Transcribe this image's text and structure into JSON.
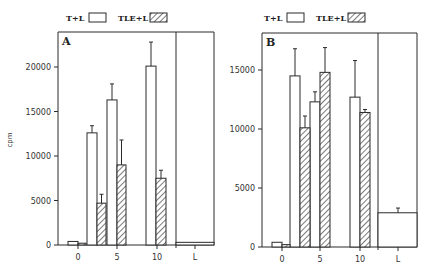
{
  "chart_data": [
    {
      "type": "bar",
      "panel": "A",
      "ylabel": "cpm",
      "ylim": [
        0,
        24000
      ],
      "yticks": [
        0,
        5000,
        10000,
        15000,
        20000
      ],
      "xtick_labels": [
        "0",
        "5",
        "10",
        "L"
      ],
      "legend": [
        {
          "name": "T+L",
          "pattern": "open"
        },
        {
          "name": "TLE+L",
          "pattern": "hatched"
        }
      ],
      "series": [
        {
          "name": "T+L",
          "x": [
            0,
            2,
            5,
            10
          ],
          "values": [
            400,
            12600,
            16300,
            20100
          ],
          "error": [
            0,
            800,
            1800,
            2700
          ]
        },
        {
          "name": "TLE+L",
          "x": [
            0,
            2,
            5,
            10
          ],
          "values": [
            200,
            4700,
            9000,
            7500
          ],
          "error": [
            0,
            1000,
            2800,
            900
          ]
        }
      ],
      "control": {
        "name": "L",
        "value": 300,
        "error": 0
      }
    },
    {
      "type": "bar",
      "panel": "B",
      "ylabel": "",
      "ylim": [
        0,
        18500
      ],
      "yticks": [
        0,
        5000,
        10000,
        15000
      ],
      "xtick_labels": [
        "0",
        "5",
        "10",
        "L"
      ],
      "legend": [
        {
          "name": "T+L",
          "pattern": "open"
        },
        {
          "name": "TLE+L",
          "pattern": "hatched"
        }
      ],
      "series": [
        {
          "name": "T+L",
          "x": [
            0,
            2,
            5,
            10
          ],
          "values": [
            400,
            14500,
            12300,
            12700
          ],
          "error": [
            0,
            2300,
            850,
            3100
          ]
        },
        {
          "name": "TLE+L",
          "x": [
            0,
            2,
            5,
            10
          ],
          "values": [
            200,
            10100,
            14800,
            11400
          ],
          "error": [
            0,
            1000,
            2100,
            250
          ]
        }
      ],
      "control": {
        "name": "L",
        "value": 2900,
        "error": 400
      }
    }
  ],
  "layout": {
    "panels": [
      {
        "label": "A",
        "frame": {
          "left": 58,
          "top": 32,
          "right": 214,
          "bottom": 245,
          "divider": 176
        },
        "y_px_per_unit": 0.0089,
        "xtick_px": [
          78,
          117,
          157,
          195
        ],
        "bars": {
          "T+L": [
            [
              68,
              78
            ],
            [
              87,
              97
            ],
            [
              107,
              117
            ],
            [
              146,
              156
            ]
          ],
          "TLE+L": [
            [
              78,
              86
            ],
            [
              97,
              106
            ],
            [
              117,
              126
            ],
            [
              156,
              166
            ]
          ]
        },
        "legend": {
          "x": 66,
          "y": 18
        },
        "show_ylabel": true
      },
      {
        "label": "B",
        "frame": {
          "left": 262,
          "top": 33,
          "right": 417,
          "bottom": 247,
          "divider": 378
        },
        "y_px_per_unit": 0.0118,
        "xtick_px": [
          282,
          320,
          360,
          398
        ],
        "bars": {
          "T+L": [
            [
              272,
              282
            ],
            [
              290,
              300
            ],
            [
              310,
              320
            ],
            [
              350,
              360
            ]
          ],
          "TLE+L": [
            [
              282,
              290
            ],
            [
              300,
              310
            ],
            [
              320,
              330
            ],
            [
              360,
              370
            ]
          ]
        },
        "legend": {
          "x": 264,
          "y": 18
        },
        "show_ylabel": false
      }
    ]
  }
}
